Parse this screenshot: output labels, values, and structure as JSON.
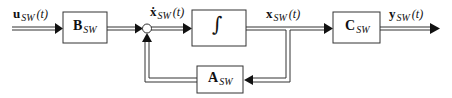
{
  "diagram": {
    "type": "state-space block diagram",
    "blocks": {
      "B": {
        "main": "B",
        "sub": "SW"
      },
      "integrator": {
        "symbol": "∫"
      },
      "C": {
        "main": "C",
        "sub": "SW"
      },
      "A": {
        "main": "A",
        "sub": "SW"
      }
    },
    "signals": {
      "input": {
        "main": "u",
        "sub": "SW",
        "arg": "(t)"
      },
      "xdot": {
        "main": "ẋ",
        "sub": "SW",
        "arg": "(t)"
      },
      "state": {
        "main": "x",
        "sub": "SW",
        "arg": "(t)"
      },
      "output": {
        "main": "y",
        "sub": "SW",
        "arg": "(t)"
      }
    },
    "colors": {
      "line": "#222222",
      "box_border": "#333333",
      "background": "#ffffff"
    }
  }
}
